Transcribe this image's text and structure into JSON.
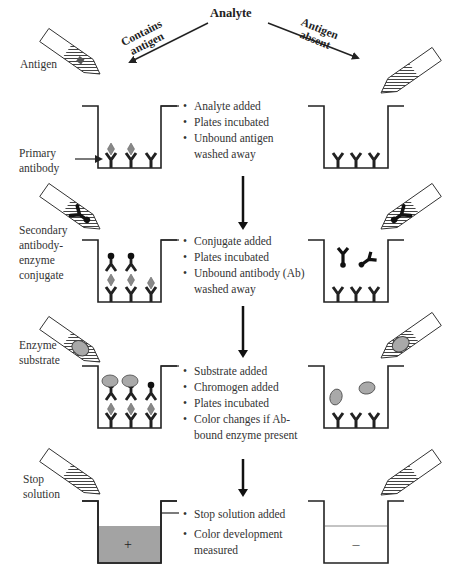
{
  "title": "Analyte",
  "branches": {
    "left": "Contains antigen",
    "left_lines": [
      "Contains",
      "antigen"
    ],
    "right": "Antigen absent",
    "right_lines": [
      "Antigen",
      "absent"
    ]
  },
  "reagent_labels": {
    "antigen": "Antigen",
    "primary_antibody": [
      "Primary",
      "antibody"
    ],
    "secondary_conjugate": [
      "Secondary",
      "antibody-",
      "enzyme",
      "conjugate"
    ],
    "enzyme_substrate": [
      "Enzyme",
      "substrate"
    ],
    "stop_solution": [
      "Stop",
      "solution"
    ]
  },
  "steps": [
    {
      "bullets": [
        "Analyte added",
        "Plates incubated",
        "Unbound antigen washed away"
      ]
    },
    {
      "bullets": [
        "Conjugate added",
        "Plates incubated",
        "Unbound antibody (Ab) washed away"
      ]
    },
    {
      "bullets": [
        "Substrate added",
        "Chromogen added",
        "Plates incubated",
        "Color changes if Ab-bound enzyme present"
      ]
    },
    {
      "bullets": [
        "Stop solution added",
        "Color development measured"
      ]
    }
  ],
  "results": {
    "positive_symbol": "+",
    "negative_symbol": "–"
  },
  "colors": {
    "line": "#222222",
    "gray_fill": "#a9a9a9",
    "positive_well_fill": "#a3a3a3",
    "hatch": "#555555"
  }
}
